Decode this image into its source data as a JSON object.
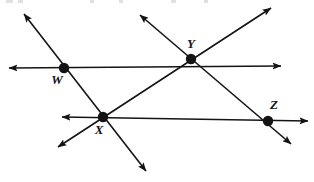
{
  "figure": {
    "background_color": "#ffffff",
    "stroke_color": "#141414",
    "label_color": "#141414",
    "width": 314,
    "height": 182,
    "stroke_width": 1.6,
    "point_radius": 5.2
  },
  "points": [
    {
      "id": "W",
      "label": "W",
      "x": 64,
      "y": 68,
      "label_x": 57,
      "label_y": 84
    },
    {
      "id": "X",
      "label": "X",
      "x": 103,
      "y": 117,
      "label_x": 99,
      "label_y": 134
    },
    {
      "id": "Y",
      "label": "Y",
      "x": 191,
      "y": 59,
      "label_x": 191,
      "label_y": 48
    },
    {
      "id": "Z",
      "label": "Z",
      "x": 268,
      "y": 121,
      "label_x": 274,
      "label_y": 109
    }
  ],
  "lines": [
    {
      "id": "upper-horizontal-line",
      "name": "line-through-W-and-Y",
      "x1": 9,
      "y1": 68,
      "x2": 281,
      "y2": 66,
      "arrow_start": true,
      "arrow_end": true,
      "passes_through": [
        "W",
        "Y"
      ]
    },
    {
      "id": "lower-horizontal-line",
      "name": "line-through-X-and-Z",
      "x1": 62,
      "y1": 117,
      "x2": 308,
      "y2": 121,
      "arrow_start": true,
      "arrow_end": true,
      "passes_through": [
        "X",
        "Z"
      ]
    },
    {
      "id": "northwest-southeast-line",
      "name": "line-through-W-and-X",
      "x1": 24,
      "y1": 14,
      "x2": 146,
      "y2": 171,
      "arrow_start": true,
      "arrow_end": true,
      "passes_through": [
        "W",
        "X"
      ]
    },
    {
      "id": "northeast-southwest-line",
      "name": "line-through-Y-and-X",
      "x1": 271,
      "y1": 8,
      "x2": 58,
      "y2": 147,
      "arrow_start": true,
      "arrow_end": true,
      "passes_through": [
        "Y",
        "X"
      ]
    },
    {
      "id": "northwest-southeast-line-2",
      "name": "line-through-Y-and-Z",
      "x1": 140,
      "y1": 15,
      "x2": 291,
      "y2": 144,
      "arrow_start": true,
      "arrow_end": true,
      "passes_through": [
        "Y",
        "Z"
      ]
    }
  ],
  "top_edge_artifacts": [
    {
      "left": 6,
      "width": 7
    },
    {
      "left": 18,
      "width": 5
    },
    {
      "left": 90,
      "width": 4
    },
    {
      "left": 119,
      "width": 4
    },
    {
      "left": 171,
      "width": 5
    },
    {
      "left": 204,
      "width": 4
    }
  ]
}
